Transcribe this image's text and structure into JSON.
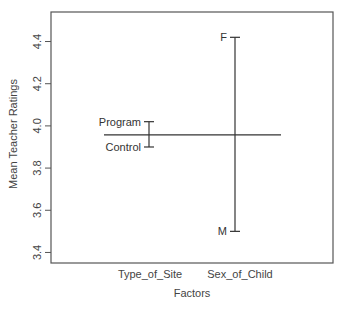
{
  "chart_data": {
    "type": "design-plot",
    "title": "",
    "xlabel": "Factors",
    "ylabel": "Mean Teacher Ratings",
    "ylim": [
      3.35,
      4.54
    ],
    "yticks": [
      3.4,
      3.6,
      3.8,
      4.0,
      4.2,
      4.4
    ],
    "ytick_labels": [
      "3.4",
      "3.6",
      "3.8",
      "4.0",
      "4.2",
      "4.4"
    ],
    "grid": false,
    "legend": null,
    "grand_mean": 3.957,
    "categories": [
      "Type_of_Site",
      "Sex_of_Child"
    ],
    "factors": [
      {
        "name": "Type_of_Site",
        "levels": [
          {
            "label": "Program",
            "value": 4.02
          },
          {
            "label": "Control",
            "value": 3.9
          }
        ]
      },
      {
        "name": "Sex_of_Child",
        "levels": [
          {
            "label": "F",
            "value": 4.42
          },
          {
            "label": "M",
            "value": 3.5
          }
        ]
      }
    ]
  },
  "colors": {
    "axis": "#555555",
    "line": "#333333",
    "text": "#444444",
    "background": "#ffffff"
  }
}
